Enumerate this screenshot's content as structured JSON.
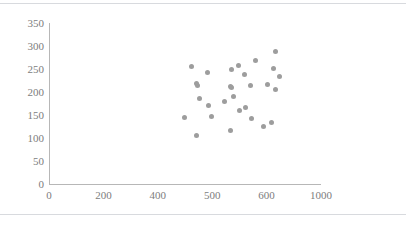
{
  "chart_data": {
    "type": "scatter",
    "title": "",
    "subtitle": "",
    "xlabel": "",
    "ylabel": "",
    "grid": false,
    "legend": false,
    "legend_position": "none",
    "marker_color": "#9d9d9d",
    "axis_color": "#b7b7b7",
    "tick_label_color": "#7d7d7d",
    "background_color": "#ffffff",
    "xlim": [
      0,
      1000
    ],
    "ylim": [
      0,
      350
    ],
    "xticks": [
      0,
      200,
      400,
      500,
      600,
      1000
    ],
    "xtick_labels": [
      "0",
      "200",
      "400",
      "500",
      "600",
      "1000"
    ],
    "yticks": [
      0,
      50,
      100,
      150,
      200,
      250,
      300,
      350
    ],
    "ytick_labels": [
      "0",
      "50",
      "100",
      "150",
      "200",
      "250",
      "300",
      "350"
    ],
    "series": [
      {
        "name": "series-1",
        "points": [
          [
            462,
            256
          ],
          [
            449,
            144
          ],
          [
            472,
            219
          ],
          [
            473,
            214
          ],
          [
            476,
            185
          ],
          [
            471,
            106
          ],
          [
            491,
            243
          ],
          [
            494,
            170
          ],
          [
            498,
            147
          ],
          [
            522,
            180
          ],
          [
            536,
            248
          ],
          [
            533,
            213
          ],
          [
            535,
            209
          ],
          [
            539,
            191
          ],
          [
            533,
            116
          ],
          [
            549,
            257
          ],
          [
            551,
            159
          ],
          [
            559,
            239
          ],
          [
            562,
            167
          ],
          [
            571,
            214
          ],
          [
            573,
            142
          ],
          [
            580,
            269
          ],
          [
            594,
            124
          ],
          [
            607,
            216
          ],
          [
            635,
            134
          ],
          [
            652,
            251
          ],
          [
            663,
            288
          ],
          [
            668,
            206
          ],
          [
            694,
            233
          ]
        ]
      }
    ]
  },
  "figure": {
    "top_rule": "",
    "bottom_rule": ""
  }
}
